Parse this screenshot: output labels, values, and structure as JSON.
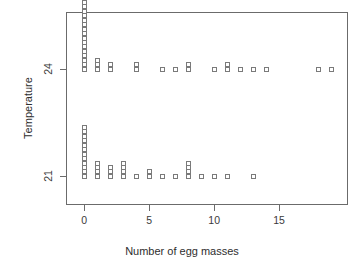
{
  "chart_data": {
    "type": "scatter",
    "plot_style": "stacked-dotplot-stripchart",
    "title": "",
    "xlabel": "Number of egg masses",
    "ylabel": "Temperature",
    "xlim": [
      -1.4,
      20.3
    ],
    "ylim": [
      20.2,
      25.6
    ],
    "xticks": [
      0,
      5,
      10,
      15
    ],
    "xticklabels": [
      "0",
      "5",
      "10",
      "15"
    ],
    "yticks": [
      21,
      24
    ],
    "yticklabels": [
      "21",
      "24"
    ],
    "grid": false,
    "legend": null,
    "marker": "open-square",
    "marker_color": "#7a7a7a",
    "frame_color": "#6b6b6b",
    "background": "#ffffff",
    "stack_direction": "up",
    "series": [
      {
        "name": "Temperature 24",
        "y": 24,
        "x": [
          0,
          1,
          2,
          4,
          6,
          7,
          8,
          10,
          11,
          12,
          13,
          14,
          18,
          19
        ],
        "counts": [
          17,
          3,
          2,
          2,
          1,
          1,
          2,
          1,
          2,
          1,
          1,
          1,
          1,
          1
        ],
        "total": 34
      },
      {
        "name": "Temperature 21",
        "y": 21,
        "x": [
          0,
          1,
          2,
          3,
          4,
          5,
          6,
          7,
          8,
          9,
          10,
          11,
          13
        ],
        "counts": [
          12,
          4,
          3,
          4,
          1,
          2,
          1,
          1,
          4,
          1,
          1,
          1,
          1
        ],
        "total": 36
      }
    ]
  },
  "axes": {
    "x_title": "Number of egg masses",
    "y_title": "Temperature",
    "x_tick_labels": [
      "0",
      "5",
      "10",
      "15"
    ],
    "y_tick_labels": [
      "21",
      "24"
    ]
  }
}
